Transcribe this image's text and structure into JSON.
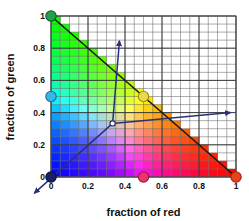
{
  "figure": {
    "background_color": "#ffffff",
    "plot_area": {
      "left_px": 51,
      "right_px": 236,
      "top_px": 16,
      "bottom_px": 177,
      "border_color": "#555555"
    }
  },
  "axes": {
    "x": {
      "label": "fraction of red",
      "min": 0,
      "max": 1,
      "ticks": [
        0,
        0.2,
        0.4,
        0.6,
        0.8,
        1
      ],
      "tick_labels": [
        "0",
        "0.2",
        "0.4",
        "0.6",
        "0.8",
        "1"
      ]
    },
    "y": {
      "label": "fraction of green",
      "min": 0,
      "max": 1,
      "ticks": [
        0,
        0.2,
        0.4,
        0.6,
        0.8,
        1
      ],
      "tick_labels": [
        "0",
        "0.2",
        "0.4",
        "0.6",
        "0.8",
        "1"
      ]
    }
  },
  "grid": {
    "visible": true,
    "minor_divisions": 20,
    "minor_color": "#6b6b6b",
    "major_color": "#333333"
  },
  "chart_data": {
    "type": "heatmap",
    "title": "",
    "xlabel": "fraction of red",
    "ylabel": "fraction of green",
    "xlim": [
      0,
      1
    ],
    "ylim": [
      0,
      1
    ],
    "grid": true,
    "legend": "none",
    "cells": 20,
    "constraint_line": {
      "from": [
        0,
        1
      ],
      "to": [
        1,
        0
      ],
      "color": "#1a1a1a"
    },
    "markers": [
      {
        "name": "green-primary",
        "x": 0,
        "y": 1,
        "color": "#22a04a",
        "edge": "#10502a"
      },
      {
        "name": "cyan-secondary",
        "x": 0,
        "y": 0.5,
        "color": "#37b6e8",
        "edge": "#1b6f9c"
      },
      {
        "name": "blue-primary",
        "x": 0,
        "y": 0,
        "color": "#1b1f63",
        "edge": "#0d1038"
      },
      {
        "name": "magenta-secondary",
        "x": 0.5,
        "y": 0,
        "color": "#e8356b",
        "edge": "#9c1b41"
      },
      {
        "name": "red-primary",
        "x": 1,
        "y": 0,
        "color": "#e8431a",
        "edge": "#9c2510"
      },
      {
        "name": "yellow-secondary",
        "x": 0.5,
        "y": 0.5,
        "color": "#ecd94a",
        "edge": "#9c8c1b"
      },
      {
        "name": "white-origin",
        "x": 0.333,
        "y": 0.333,
        "color": "#ffffff",
        "edge": "#2b2f7a"
      }
    ],
    "arrows": [
      {
        "name": "arrow-up",
        "from": [
          0.333,
          0.333
        ],
        "to": [
          0.37,
          0.845
        ],
        "color": "#2b2f7a"
      },
      {
        "name": "arrow-right",
        "from": [
          0.333,
          0.333
        ],
        "to": [
          0.97,
          0.4
        ],
        "color": "#2b2f7a"
      },
      {
        "name": "arrow-down-left",
        "from": [
          0.333,
          0.333
        ],
        "to": [
          -0.09,
          -0.1
        ],
        "color": "#2b2f7a"
      }
    ]
  }
}
